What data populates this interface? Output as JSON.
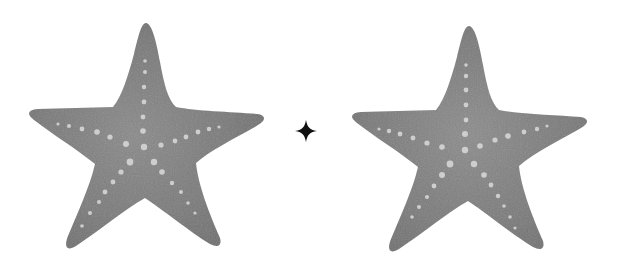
{
  "scene": {
    "background": "#ffffff",
    "description": "Two watercolor gray starfish with a small black four-point sparkle between them",
    "starfish": [
      {
        "id": "left",
        "offset_x": 0,
        "offset_y": 0,
        "fill": "#7a7a7a",
        "fill_light": "#9a9a9a",
        "dot_color": "#d8d8d8"
      },
      {
        "id": "right",
        "offset_x": 322,
        "offset_y": 2,
        "fill": "#7c7c7c",
        "fill_light": "#9c9c9c",
        "dot_color": "#d8d8d8"
      }
    ],
    "sparkle": {
      "cx": 306,
      "cy": 131,
      "size": 11,
      "color": "#111111"
    }
  }
}
